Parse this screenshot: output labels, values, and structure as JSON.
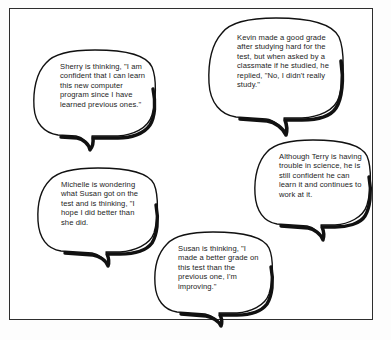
{
  "figure": {
    "frame_color": "#2e2e2e",
    "bubble_fill": "#ffffff",
    "bubble_stroke": "#111111",
    "text_color": "#1c1c1c",
    "background": "#ffffff"
  },
  "bubbles": [
    {
      "id": "sherry",
      "speaker": "Sherry",
      "text": "Sherry is thinking, \"I am confident that I can learn this new computer program since I have learned previous ones.\""
    },
    {
      "id": "kevin",
      "speaker": "Kevin",
      "text": "Kevin made a good grade after studying hard for the test, but when asked by a classmate if he studied, he replied, \"No, I didn't really study.\""
    },
    {
      "id": "terry",
      "speaker": "Terry",
      "text": "Although Terry is having trouble in science, he is still confident he can learn it and continues to work at it."
    },
    {
      "id": "michelle",
      "speaker": "Michelle",
      "text": "Michelle is wondering what Susan got on the test and is thinking, \"I hope I did better than she did."
    },
    {
      "id": "susan",
      "speaker": "Susan",
      "text": "Susan is thinking, \"I made a better grade on this test than the previous one, I'm improving.\""
    }
  ]
}
